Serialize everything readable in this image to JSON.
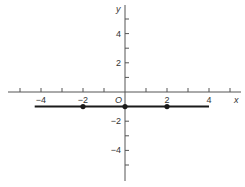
{
  "chart_data": {
    "type": "line",
    "title": "",
    "xlabel": "x",
    "ylabel": "y",
    "origin_label": "O",
    "xlim": [
      -5.6,
      5.4
    ],
    "ylim": [
      -6,
      6
    ],
    "x_ticks": [
      -5,
      -4,
      -3,
      -2,
      -1,
      1,
      2,
      3,
      4,
      5
    ],
    "x_tick_labels": [
      {
        "value": -4,
        "label": "−4"
      },
      {
        "value": -2,
        "label": "−2"
      },
      {
        "value": 2,
        "label": "2"
      },
      {
        "value": 4,
        "label": "4"
      }
    ],
    "y_ticks": [
      5,
      4,
      3,
      2,
      1,
      -1,
      -2,
      -3,
      -4,
      -5
    ],
    "y_tick_labels": [
      {
        "value": 4,
        "label": "4"
      },
      {
        "value": 2,
        "label": "2"
      },
      {
        "value": -2,
        "label": "−2"
      },
      {
        "value": -4,
        "label": "−4"
      }
    ],
    "grid": false,
    "series": [
      {
        "name": "y = -1",
        "segment": {
          "x": [
            -4.3,
            4
          ],
          "y": [
            -1,
            -1
          ]
        },
        "points": [
          {
            "x": -2,
            "y": -1
          },
          {
            "x": 0,
            "y": -1
          },
          {
            "x": 2,
            "y": -1
          }
        ]
      }
    ]
  },
  "colors": {
    "axis": "#555555",
    "line": "#1a1a1a",
    "text": "#333333"
  }
}
